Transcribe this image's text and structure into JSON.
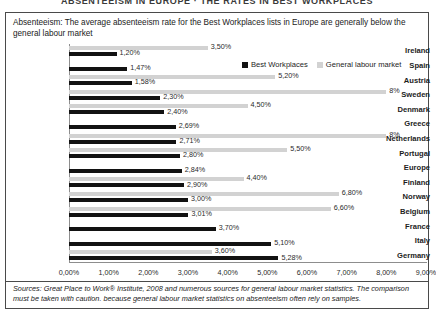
{
  "banner_title": "ABSENTEEISM IN EUROPE · THE RATES IN BEST WORKPLACES",
  "headline": "Absenteeism: The average absenteeism rate for the Best Workplaces lists in Europe are generally below the general labour market",
  "legend": {
    "best_label": "Best Workplaces",
    "general_label": "General labour market",
    "best_color": "#121212",
    "general_color": "#d2d2d2"
  },
  "footer": "Sources: Great Place to Work® Institute, 2008 and numerous sources for general labour market statistics. The comparison must be taken with caution. because general labour market statistics on absenteeism often rely on samples.",
  "chart_data": {
    "type": "bar",
    "orientation": "horizontal",
    "title": "Absenteeism: The average absenteeism rate for the Best Workplaces lists in Europe are generally below the general labour market",
    "xlabel": "",
    "ylabel": "",
    "xlim": [
      0,
      9
    ],
    "grid": false,
    "legend_position": "top-right",
    "xticks": [
      "0,00%",
      "1,00%",
      "2,00%",
      "3,00%",
      "4,00%",
      "5,00%",
      "6,00%",
      "7,00%",
      "8,00%",
      "9,00%"
    ],
    "xtick_values": [
      0,
      1,
      2,
      3,
      4,
      5,
      6,
      7,
      8,
      9
    ],
    "categories": [
      "Ireland",
      "Spain",
      "Austria",
      "Sweden",
      "Denmark",
      "Greece",
      "Netherlands",
      "Portugal",
      "Europe",
      "Finland",
      "Norway",
      "Belgium",
      "France",
      "Italy",
      "Germany"
    ],
    "series": [
      {
        "name": "Best Workplaces",
        "color": "#121212",
        "values": [
          1.2,
          1.47,
          1.58,
          2.3,
          2.4,
          2.69,
          2.71,
          2.8,
          2.84,
          2.9,
          3.0,
          3.01,
          3.7,
          5.1,
          5.28
        ],
        "labels": [
          "1,20%",
          "1,47%",
          "1,58%",
          "2,30%",
          "2,40%",
          "2,69%",
          "2,71%",
          "2,80%",
          "2,84%",
          "2,90%",
          "3,00%",
          "3,01%",
          "3,70%",
          "5,10%",
          "5,28%"
        ]
      },
      {
        "name": "General labour market",
        "color": "#d2d2d2",
        "values": [
          3.5,
          null,
          5.2,
          8.0,
          4.5,
          null,
          8.0,
          5.5,
          null,
          4.4,
          6.8,
          6.6,
          null,
          null,
          3.6
        ],
        "labels": [
          "3,50%",
          "",
          "5,20%",
          "8%",
          "4,50%",
          "",
          "8%",
          "5,50%",
          "",
          "4,40%",
          "6,80%",
          "6,60%",
          "",
          "",
          "3,60%"
        ]
      }
    ]
  }
}
